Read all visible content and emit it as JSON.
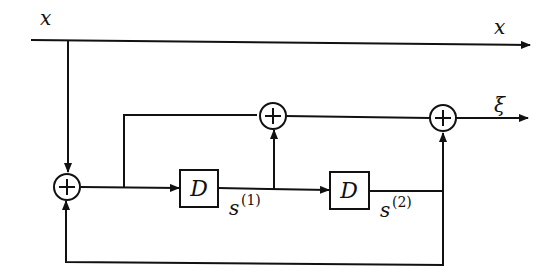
{
  "diagram": {
    "type": "signal-flow block diagram",
    "colors": {
      "stroke": "#111111",
      "background": "#ffffff"
    },
    "labels": {
      "input": "x",
      "output_x": "x",
      "output_xi": "ξ",
      "delay1": "D",
      "delay2": "D",
      "state1_base": "s",
      "state1_sup": "(1)",
      "state2_base": "s",
      "state2_sup": "(2)"
    },
    "nodes": [
      {
        "id": "adder-input",
        "symbol": "+"
      },
      {
        "id": "adder-middle",
        "symbol": "+"
      },
      {
        "id": "adder-output",
        "symbol": "+"
      },
      {
        "id": "delay-1",
        "label": "D"
      },
      {
        "id": "delay-2",
        "label": "D"
      }
    ]
  }
}
